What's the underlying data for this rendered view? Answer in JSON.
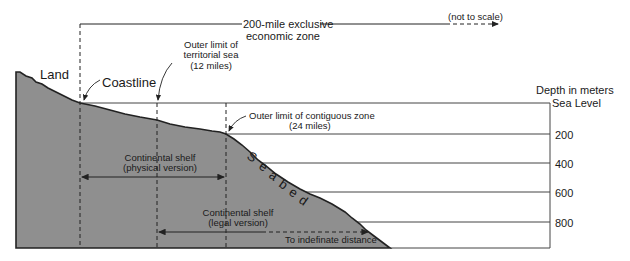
{
  "diagram": {
    "eez_label_line1": "200-mile exclusive",
    "eez_label_line2": "economic zone",
    "not_to_scale": "(not to scale)",
    "land": "Land",
    "coastline": "Coastline",
    "territorial_line1": "Outer limit of",
    "territorial_line2": "territorial sea",
    "territorial_line3": "(12 miles)",
    "contiguous_line1": "Outer limit of contiguous zone",
    "contiguous_line2": "(24 miles)",
    "depth_title": "Depth  in  meters",
    "sea_level": "Sea Level",
    "depth_ticks": [
      "200",
      "400",
      "600",
      "800"
    ],
    "seabed": "Seabed",
    "shelf_physical_line1": "Continental shelf",
    "shelf_physical_line2": "(physical version)",
    "shelf_legal_line1": "Continental shelf",
    "shelf_legal_line2": "(legal version)",
    "indefinite": "To indefinate distance",
    "colors": {
      "seabed_fill": "#8f8f8f",
      "line": "#222222"
    }
  }
}
